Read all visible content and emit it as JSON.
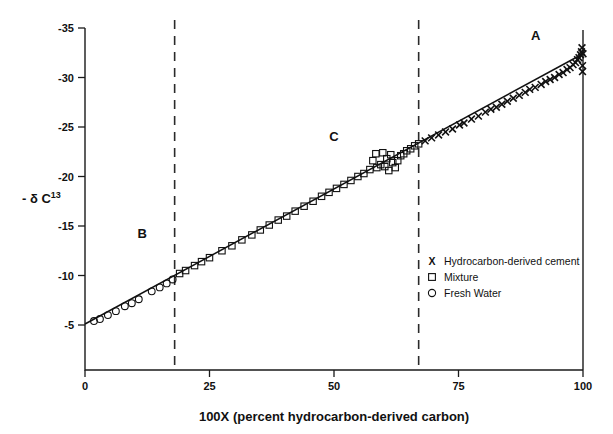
{
  "chart_data": {
    "type": "scatter",
    "title": "",
    "xlabel": "100X  (percent hydrocarbon-derived carbon)",
    "ylabel": "- δ C",
    "ylabel_superscript": "13",
    "xlim": [
      0,
      100
    ],
    "ylim": [
      0,
      -36.5
    ],
    "xticks": [
      0,
      25,
      50,
      75,
      100
    ],
    "xtick_labels": [
      "0",
      "25",
      "50",
      "75",
      "100"
    ],
    "yticks": [
      -5,
      -10,
      -15,
      -20,
      -25,
      -30,
      -35
    ],
    "ytick_labels": [
      "-5",
      "-10",
      "-15",
      "-20",
      "-25",
      "-30",
      "-35"
    ],
    "grid": false,
    "legend_position": "lower-right",
    "annotations": [
      {
        "text": "A",
        "x": 90.5,
        "y": -33.8
      },
      {
        "text": "B",
        "x": 11.5,
        "y": -13.8
      },
      {
        "text": "C",
        "x": 50.0,
        "y": -23.6
      }
    ],
    "reference_lines": [
      {
        "orientation": "vertical",
        "x": 18,
        "style": "dashed"
      },
      {
        "orientation": "vertical",
        "x": 67,
        "style": "dashed"
      }
    ],
    "trend_line": {
      "name": "Mixing line",
      "x": [
        0,
        100
      ],
      "y": [
        -5.1,
        -32.4
      ],
      "style": "solid"
    },
    "series": [
      {
        "name": "Hydrocarbon-derived cement",
        "marker": "x",
        "points": [
          [
            68.3,
            -23.6
          ],
          [
            69.6,
            -23.9
          ],
          [
            71.0,
            -24.2
          ],
          [
            72.4,
            -24.5
          ],
          [
            73.8,
            -24.8
          ],
          [
            75.2,
            -25.2
          ],
          [
            76.1,
            -25.4
          ],
          [
            77.6,
            -25.8
          ],
          [
            79.0,
            -26.1
          ],
          [
            80.4,
            -26.5
          ],
          [
            81.5,
            -26.8
          ],
          [
            82.6,
            -27.0
          ],
          [
            83.7,
            -27.3
          ],
          [
            84.8,
            -27.6
          ],
          [
            86.0,
            -27.9
          ],
          [
            87.2,
            -28.2
          ],
          [
            88.4,
            -28.5
          ],
          [
            89.3,
            -28.8
          ],
          [
            90.4,
            -29.0
          ],
          [
            91.6,
            -29.3
          ],
          [
            92.5,
            -29.6
          ],
          [
            93.4,
            -29.8
          ],
          [
            94.3,
            -30.0
          ],
          [
            95.2,
            -30.3
          ],
          [
            96.0,
            -30.5
          ],
          [
            96.8,
            -30.8
          ],
          [
            97.4,
            -31.0
          ],
          [
            98.0,
            -31.3
          ],
          [
            98.5,
            -31.5
          ],
          [
            98.9,
            -31.8
          ],
          [
            99.2,
            -32.0
          ],
          [
            99.5,
            -32.3
          ],
          [
            99.7,
            -32.6
          ],
          [
            99.8,
            -33.0
          ],
          [
            99.9,
            -31.2
          ],
          [
            99.9,
            -30.6
          ],
          [
            100.0,
            -32.4
          ]
        ]
      },
      {
        "name": "Mixture",
        "marker": "square",
        "points": [
          [
            19.0,
            -10.2
          ],
          [
            20.2,
            -10.5
          ],
          [
            22.0,
            -11.0
          ],
          [
            23.4,
            -11.4
          ],
          [
            25.0,
            -11.8
          ],
          [
            27.5,
            -12.5
          ],
          [
            29.5,
            -13.0
          ],
          [
            31.5,
            -13.6
          ],
          [
            33.5,
            -14.1
          ],
          [
            35.2,
            -14.6
          ],
          [
            37.0,
            -15.1
          ],
          [
            38.8,
            -15.6
          ],
          [
            40.5,
            -16.0
          ],
          [
            42.2,
            -16.5
          ],
          [
            44.0,
            -17.0
          ],
          [
            45.8,
            -17.5
          ],
          [
            47.5,
            -18.0
          ],
          [
            49.0,
            -18.4
          ],
          [
            50.5,
            -18.8
          ],
          [
            52.0,
            -19.2
          ],
          [
            53.4,
            -19.6
          ],
          [
            54.8,
            -20.0
          ],
          [
            56.0,
            -20.3
          ],
          [
            57.2,
            -20.7
          ],
          [
            57.8,
            -21.6
          ],
          [
            58.4,
            -22.3
          ],
          [
            58.6,
            -20.9
          ],
          [
            59.4,
            -21.2
          ],
          [
            59.8,
            -22.4
          ],
          [
            60.2,
            -21.0
          ],
          [
            60.6,
            -21.8
          ],
          [
            61.0,
            -20.6
          ],
          [
            61.4,
            -22.2
          ],
          [
            61.8,
            -21.4
          ],
          [
            62.3,
            -20.9
          ],
          [
            62.8,
            -21.6
          ],
          [
            63.4,
            -22.1
          ],
          [
            64.0,
            -22.3
          ],
          [
            64.6,
            -22.6
          ],
          [
            65.4,
            -22.8
          ],
          [
            66.2,
            -23.1
          ],
          [
            67.0,
            -23.3
          ]
        ]
      },
      {
        "name": "Fresh Water",
        "marker": "circle",
        "points": [
          [
            1.8,
            -5.4
          ],
          [
            3.0,
            -5.6
          ],
          [
            4.6,
            -6.0
          ],
          [
            6.2,
            -6.4
          ],
          [
            8.0,
            -6.9
          ],
          [
            9.4,
            -7.2
          ],
          [
            10.8,
            -7.6
          ],
          [
            13.4,
            -8.4
          ],
          [
            15.0,
            -8.8
          ],
          [
            16.4,
            -9.2
          ],
          [
            17.6,
            -9.6
          ]
        ]
      }
    ],
    "legend": [
      {
        "marker": "x",
        "label": "Hydrocarbon-derived cement"
      },
      {
        "marker": "square",
        "label": "Mixture"
      },
      {
        "marker": "circle",
        "label": "Fresh Water"
      }
    ]
  },
  "colors": {
    "ink": "#111111",
    "background": "#ffffff"
  }
}
